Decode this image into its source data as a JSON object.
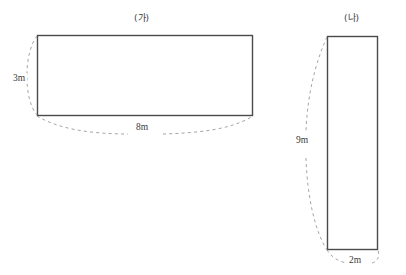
{
  "diagram": {
    "background_color": "#ffffff",
    "stroke_color": "#4a4a4a",
    "dashed_color": "#9a9a9a",
    "figures": [
      {
        "name": "figure-ga",
        "caption": "(가)",
        "shape": "rectangle",
        "width_label": "8m",
        "height_label": "3m",
        "width_value": 8,
        "height_value": 3,
        "unit": "m",
        "area": 24
      },
      {
        "name": "figure-na",
        "caption": "(나)",
        "shape": "rectangle",
        "width_label": "2m",
        "height_label": "9m",
        "width_value": 2,
        "height_value": 9,
        "unit": "m",
        "area": 18
      }
    ]
  }
}
